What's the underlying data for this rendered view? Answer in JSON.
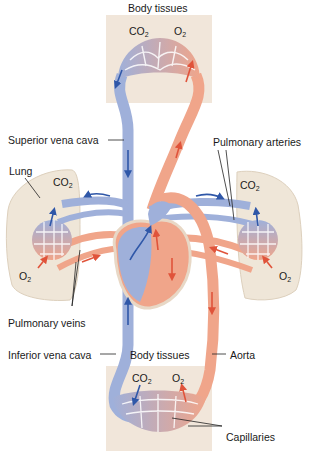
{
  "colors": {
    "oxygenated": "#f0a58a",
    "oxygenated_arrow": "#e0533a",
    "deoxygenated": "#9fb0da",
    "deoxygenated_arrow": "#2f57a8",
    "tissue_box": "#f1e6da",
    "lung": "#efe6d8",
    "capillary_mid": "#c9b7c4",
    "leader_line": "#222222"
  },
  "labels": {
    "body_tissues_top": "Body tissues",
    "superior_vena_cava": "Superior vena cava",
    "pulmonary_arteries": "Pulmonary arteries",
    "lung": "Lung",
    "pulmonary_veins": "Pulmonary veins",
    "inferior_vena_cava": "Inferior vena cava",
    "body_tissues_bottom": "Body tissues",
    "aorta": "Aorta",
    "capillaries": "Capillaries"
  },
  "gases": {
    "top_co2": {
      "base": "CO",
      "sub": "2"
    },
    "top_o2": {
      "base": "O",
      "sub": "2"
    },
    "left_lung_co2": {
      "base": "CO",
      "sub": "2"
    },
    "left_lung_o2": {
      "base": "O",
      "sub": "2"
    },
    "right_lung_co2": {
      "base": "CO",
      "sub": "2"
    },
    "right_lung_o2": {
      "base": "O",
      "sub": "2"
    },
    "bottom_co2": {
      "base": "CO",
      "sub": "2"
    },
    "bottom_o2": {
      "base": "O",
      "sub": "2"
    }
  }
}
